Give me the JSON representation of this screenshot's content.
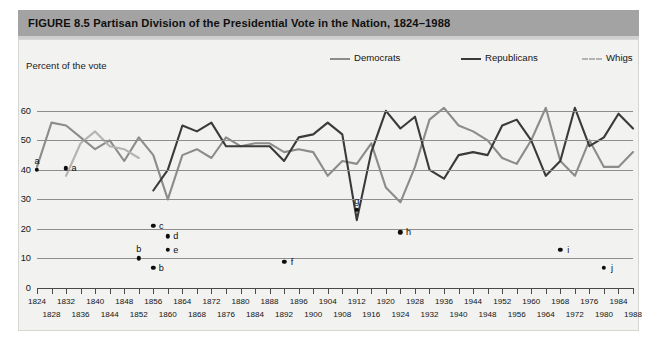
{
  "figure": {
    "title": "FIGURE 8.5  Partisan Division of the Presidential Vote in the Nation, 1824–1988",
    "title_band_color": "#a3a3a3",
    "background_color": "#f2f2f0",
    "axis_caption": "Percent of the vote"
  },
  "legend": {
    "items": [
      {
        "label": "Democrats",
        "color": "#8c8c8c",
        "x": 0,
        "dashed": false
      },
      {
        "label": "Republicans",
        "color": "#3a3a3a",
        "x": 131,
        "dashed": false
      },
      {
        "label": "Whigs",
        "color": "#b3b3b3",
        "x": 252,
        "dashed": true
      }
    ]
  },
  "chart_data": {
    "type": "line",
    "title": "Partisan Division of the Presidential Vote in the Nation, 1824–1988",
    "xlabel": "",
    "ylabel": "Percent of the vote",
    "ylim": [
      0,
      65
    ],
    "yticks": [
      0,
      10,
      20,
      30,
      40,
      50,
      60
    ],
    "grid": true,
    "legend_position": "top-right",
    "x": [
      1824,
      1828,
      1832,
      1836,
      1840,
      1844,
      1848,
      1852,
      1856,
      1860,
      1864,
      1868,
      1872,
      1876,
      1880,
      1884,
      1888,
      1892,
      1896,
      1900,
      1904,
      1908,
      1912,
      1916,
      1920,
      1924,
      1928,
      1932,
      1936,
      1940,
      1944,
      1948,
      1952,
      1956,
      1960,
      1964,
      1968,
      1972,
      1976,
      1980,
      1984,
      1988
    ],
    "series": [
      {
        "name": "Democrats",
        "color": "#8c8c8c",
        "values": [
          41,
          56,
          55,
          51,
          47,
          50,
          43,
          51,
          45,
          30,
          45,
          47,
          44,
          51,
          48,
          49,
          49,
          46,
          47,
          46,
          38,
          43,
          42,
          49,
          34,
          29,
          41,
          57,
          61,
          55,
          53,
          50,
          44,
          42,
          50,
          61,
          43,
          38,
          50,
          41,
          41,
          46
        ]
      },
      {
        "name": "Republicans",
        "color": "#3a3a3a",
        "values": [
          null,
          null,
          null,
          null,
          null,
          null,
          null,
          null,
          33,
          40,
          55,
          53,
          56,
          48,
          48,
          48,
          48,
          43,
          51,
          52,
          56,
          52,
          23,
          46,
          60,
          54,
          58,
          40,
          37,
          45,
          46,
          45,
          55,
          57,
          50,
          38,
          43,
          61,
          48,
          51,
          59,
          54
        ]
      },
      {
        "name": "Whigs",
        "color": "#b3b3b3",
        "values": [
          null,
          null,
          38,
          49,
          53,
          48,
          47,
          44,
          null,
          null,
          null,
          null,
          null,
          null,
          null,
          null,
          null,
          null,
          null,
          null,
          null,
          null,
          null,
          null,
          null,
          null,
          null,
          null,
          null,
          null,
          null,
          null,
          null,
          null,
          null,
          null,
          null,
          null,
          null,
          null,
          null,
          null
        ]
      }
    ],
    "annotations": [
      {
        "label": "a",
        "x": 1824,
        "y": 40.0,
        "label_pos": "above"
      },
      {
        "label": "a",
        "x": 1832,
        "y": 40.5,
        "label_pos": "right"
      },
      {
        "label": "c",
        "x": 1856,
        "y": 21.0,
        "label_pos": "right"
      },
      {
        "label": "d",
        "x": 1860,
        "y": 17.5,
        "label_pos": "right"
      },
      {
        "label": "e",
        "x": 1860,
        "y": 13.0,
        "label_pos": "right"
      },
      {
        "label": "b",
        "x": 1852,
        "y": 10.0,
        "label_pos": "above"
      },
      {
        "label": "b",
        "x": 1856,
        "y": 6.8,
        "label_pos": "right"
      },
      {
        "label": "f",
        "x": 1892,
        "y": 8.8,
        "label_pos": "right"
      },
      {
        "label": "g",
        "x": 1912,
        "y": 26.5,
        "label_pos": "above"
      },
      {
        "label": "h",
        "x": 1924,
        "y": 18.8,
        "label_pos": "right"
      },
      {
        "label": "i",
        "x": 1968,
        "y": 13.0,
        "label_pos": "right"
      },
      {
        "label": "j",
        "x": 1980,
        "y": 6.8,
        "label_pos": "right"
      }
    ]
  },
  "xaxis": {
    "row1": [
      1824,
      1832,
      1840,
      1848,
      1856,
      1864,
      1872,
      1880,
      1888,
      1896,
      1904,
      1912,
      1920,
      1928,
      1936,
      1944,
      1952,
      1960,
      1968,
      1976,
      1984
    ],
    "row2": [
      1828,
      1836,
      1844,
      1852,
      1860,
      1868,
      1876,
      1884,
      1892,
      1900,
      1908,
      1916,
      1924,
      1932,
      1940,
      1948,
      1956,
      1964,
      1972,
      1980,
      1988
    ]
  }
}
